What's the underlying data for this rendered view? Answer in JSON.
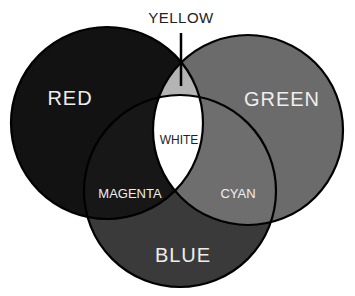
{
  "diagram": {
    "type": "venn-additive-color",
    "sets": [
      {
        "name": "RED",
        "fill": "#121212"
      },
      {
        "name": "GREEN",
        "fill": "#6b6b6b"
      },
      {
        "name": "BLUE",
        "fill": "#3a3a3a"
      }
    ],
    "intersections": {
      "yellow": {
        "label": "YELLOW",
        "fill": "#b4b4b4"
      },
      "magenta": {
        "label": "MAGENTA",
        "fill": "#171717"
      },
      "cyan": {
        "label": "CYAN",
        "fill": "#6e6e6e"
      },
      "white": {
        "label": "WHITE",
        "fill": "#ffffff"
      }
    },
    "labels": {
      "red": "RED",
      "green": "GREEN",
      "blue": "BLUE",
      "yellow": "YELLOW",
      "magenta": "MAGENTA",
      "cyan": "CYAN",
      "white": "WHITE"
    },
    "colors": {
      "outline": "#000000",
      "label_light": "#eeeeee",
      "label_dark": "#222222"
    }
  }
}
